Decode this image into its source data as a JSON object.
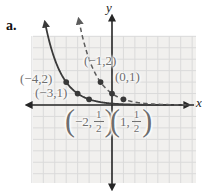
{
  "figure_label": "a.",
  "axes": {
    "x_label": "x",
    "y_label": "y"
  },
  "colors": {
    "plot_bg": "#f1f0ee",
    "grid": "#dadada",
    "axis": "#262626",
    "solid_curve": "#3a3a3a",
    "dashed_curve": "#5c5c5c",
    "point": "#383838",
    "label_text": "#6e6e6e"
  },
  "chart_data": {
    "type": "line",
    "title": "",
    "xlabel": "x",
    "ylabel": "y",
    "xlim": [
      -7,
      7.3
    ],
    "ylim": [
      -6.9,
      7.5
    ],
    "grid": true,
    "series": [
      {
        "name": "solid-exponential",
        "style": "solid",
        "function": "y = (1/2)^(x+3)",
        "base": 0.5,
        "x_shift": 3,
        "marked_points": [
          [
            -4,
            2
          ],
          [
            -3,
            1
          ],
          [
            -2,
            0.5
          ]
        ]
      },
      {
        "name": "dashed-exponential",
        "style": "dashed",
        "function": "y = (1/2)^x",
        "base": 0.5,
        "x_shift": 0,
        "marked_points": [
          [
            -1,
            2
          ],
          [
            0,
            1
          ],
          [
            1,
            0.5
          ]
        ]
      }
    ],
    "point_labels": [
      {
        "id": "neg4-2",
        "text": "(−4,2)"
      },
      {
        "id": "neg3-1",
        "text": "(−3,1)"
      },
      {
        "id": "neg1-2",
        "text": "(−1,2)"
      },
      {
        "id": "0-1",
        "text": "(0,1)"
      },
      {
        "id": "neg2-half",
        "open": "(",
        "pre": "−2,",
        "num": "1",
        "den": "2",
        "close": ")"
      },
      {
        "id": "1-half",
        "open": "(",
        "pre": "1,",
        "num": "1",
        "den": "2",
        "close": ")"
      }
    ]
  }
}
